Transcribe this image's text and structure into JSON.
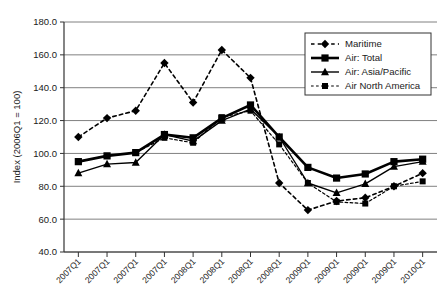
{
  "chart_data": {
    "type": "line",
    "title": "",
    "subtitle": "",
    "xlabel": "",
    "ylabel": "Index (2006Q1 = 100)",
    "ylim": [
      40.0,
      180.0
    ],
    "yticks": [
      "40.0",
      "60.0",
      "80.0",
      "100.0",
      "120.0",
      "140.0",
      "160.0",
      "180.0"
    ],
    "ytick_values": [
      40,
      60,
      80,
      100,
      120,
      140,
      160,
      180
    ],
    "grid": "horizontal",
    "legend_position": "top-right",
    "categories": [
      "2007Q1",
      "2007Q1",
      "2007Q1",
      "2007Q1",
      "2008Q1",
      "2008Q1",
      "2008Q1",
      "2008Q1",
      "2009Q1",
      "2009Q1",
      "2009Q1",
      "2009Q1",
      "2010Q1"
    ],
    "series": [
      {
        "name": "Maritime",
        "marker": "diamond",
        "linestyle": "dashed",
        "linewidth": 1.6,
        "color": "#000000",
        "values": [
          110.0,
          121.5,
          126.0,
          155.0,
          131.0,
          163.0,
          146.0,
          82.0,
          65.5,
          71.0,
          73.0,
          80.0,
          88.0
        ]
      },
      {
        "name": "Air: Total",
        "marker": "square",
        "linestyle": "solid",
        "linewidth": 2.6,
        "color": "#000000",
        "values": [
          95.0,
          98.5,
          100.5,
          111.5,
          109.5,
          121.5,
          129.5,
          110.0,
          91.5,
          85.0,
          87.5,
          95.0,
          96.5
        ]
      },
      {
        "name": "Air: Asia/Pacific",
        "marker": "triangle",
        "linestyle": "solid",
        "linewidth": 1.4,
        "color": "#000000",
        "values": [
          88.0,
          93.5,
          94.5,
          111.5,
          107.5,
          120.0,
          127.0,
          110.0,
          82.0,
          76.0,
          81.5,
          92.0,
          95.0
        ]
      },
      {
        "name": "Air North America",
        "marker": "square-small",
        "linestyle": "dashed",
        "linewidth": 1.2,
        "color": "#000000",
        "values": [
          95.0,
          98.5,
          100.5,
          109.5,
          106.5,
          122.0,
          126.0,
          105.5,
          82.0,
          70.5,
          69.5,
          80.0,
          83.0
        ]
      }
    ]
  },
  "legend": {
    "items": [
      {
        "label": "Maritime"
      },
      {
        "label": "Air: Total"
      },
      {
        "label": "Air: Asia/Pacific"
      },
      {
        "label": "Air North America"
      }
    ]
  }
}
